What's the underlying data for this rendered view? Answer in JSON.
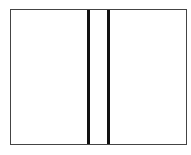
{
  "diagram": {
    "type": "rectangle-with-two-vertical-dividers",
    "frame_color": "#444444",
    "divider_color": "#111111",
    "panels": [
      "left",
      "middle",
      "right"
    ],
    "dividers": [
      {
        "name": "left-divider"
      },
      {
        "name": "right-divider"
      }
    ]
  }
}
